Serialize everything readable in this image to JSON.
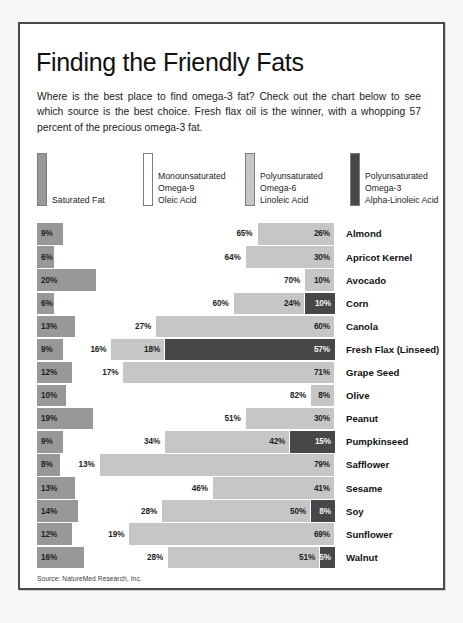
{
  "header": {
    "title": "Finding the Friendly Fats",
    "intro": "Where is the best place to find omega-3 fat? Check out the chart below to see which source is the best choice. Fresh flax oil is the winner, with a whopping 57 percent of the precious omega-3 fat."
  },
  "legend": {
    "items": [
      {
        "key": "saturated",
        "color": "#989898",
        "lines": [
          "Saturated Fat"
        ]
      },
      {
        "key": "monounsaturated",
        "color": "#ffffff",
        "lines": [
          "Monounsaturated",
          "Omega-9",
          "Oleic Acid"
        ]
      },
      {
        "key": "omega6",
        "color": "#c6c6c6",
        "lines": [
          "Polyunsaturated",
          "Omega-6",
          "Linoleic Acid"
        ]
      },
      {
        "key": "omega3",
        "color": "#474747",
        "lines": [
          "Polyunsaturated",
          "Omega-3",
          "Alpha-Linoleic Acid"
        ]
      }
    ]
  },
  "source": "Source: NatureMed Research, Inc.",
  "chart_data": {
    "type": "bar",
    "subtype": "stacked-horizontal-100pct",
    "title": "Finding the Friendly Fats",
    "xlabel": "",
    "ylabel": "",
    "xlim": [
      0,
      100
    ],
    "grid": false,
    "legend_position": "top",
    "value_suffix": "%",
    "series": [
      {
        "name": "Saturated Fat",
        "color": "#989898",
        "label_color": "#1f1f1f",
        "values": [
          9,
          6,
          20,
          6,
          13,
          9,
          12,
          10,
          19,
          9,
          8,
          13,
          14,
          12,
          16
        ]
      },
      {
        "name": "Monounsaturated Omega-9 Oleic Acid",
        "color": "#ffffff",
        "label_color": "#1f1f1f",
        "values": [
          65,
          64,
          70,
          60,
          27,
          16,
          17,
          82,
          51,
          34,
          13,
          46,
          28,
          19,
          28
        ]
      },
      {
        "name": "Polyunsaturated Omega-6 Linoleic Acid",
        "color": "#c6c6c6",
        "label_color": "#1f1f1f",
        "values": [
          26,
          30,
          10,
          24,
          60,
          18,
          71,
          8,
          30,
          42,
          79,
          41,
          50,
          69,
          51
        ]
      },
      {
        "name": "Polyunsaturated Omega-3 Alpha-Linoleic Acid",
        "color": "#474747",
        "label_color": "#f2f2f2",
        "values": [
          0,
          0,
          0,
          10,
          0,
          57,
          0,
          0,
          0,
          15,
          0,
          0,
          8,
          0,
          5
        ]
      }
    ],
    "categories": [
      "Almond",
      "Apricot Kernel",
      "Avocado",
      "Corn",
      "Canola",
      "Fresh Flax (Linseed)",
      "Grape Seed",
      "Olive",
      "Peanut",
      "Pumpkinseed",
      "Safflower",
      "Sesame",
      "Soy",
      "Sunflower",
      "Walnut"
    ],
    "rows": [
      {
        "label": "Almond",
        "saturated": 9,
        "mono": 65,
        "omega6": 26,
        "omega3": 0
      },
      {
        "label": "Apricot Kernel",
        "saturated": 6,
        "mono": 64,
        "omega6": 30,
        "omega3": 0
      },
      {
        "label": "Avocado",
        "saturated": 20,
        "mono": 70,
        "omega6": 10,
        "omega3": 0
      },
      {
        "label": "Corn",
        "saturated": 6,
        "mono": 60,
        "omega6": 24,
        "omega3": 10
      },
      {
        "label": "Canola",
        "saturated": 13,
        "mono": 27,
        "omega6": 60,
        "omega3": 0
      },
      {
        "label": "Fresh Flax (Linseed)",
        "saturated": 9,
        "mono": 16,
        "omega6": 18,
        "omega3": 57
      },
      {
        "label": "Grape Seed",
        "saturated": 12,
        "mono": 17,
        "omega6": 71,
        "omega3": 0
      },
      {
        "label": "Olive",
        "saturated": 10,
        "mono": 82,
        "omega6": 8,
        "omega3": 0
      },
      {
        "label": "Peanut",
        "saturated": 19,
        "mono": 51,
        "omega6": 30,
        "omega3": 0
      },
      {
        "label": "Pumpkinseed",
        "saturated": 9,
        "mono": 34,
        "omega6": 42,
        "omega3": 15
      },
      {
        "label": "Safflower",
        "saturated": 8,
        "mono": 13,
        "omega6": 79,
        "omega3": 0
      },
      {
        "label": "Sesame",
        "saturated": 13,
        "mono": 46,
        "omega6": 41,
        "omega3": 0
      },
      {
        "label": "Soy",
        "saturated": 14,
        "mono": 28,
        "omega6": 50,
        "omega3": 8
      },
      {
        "label": "Sunflower",
        "saturated": 12,
        "mono": 19,
        "omega6": 69,
        "omega3": 0
      },
      {
        "label": "Walnut",
        "saturated": 16,
        "mono": 28,
        "omega6": 51,
        "omega3": 5
      }
    ]
  }
}
